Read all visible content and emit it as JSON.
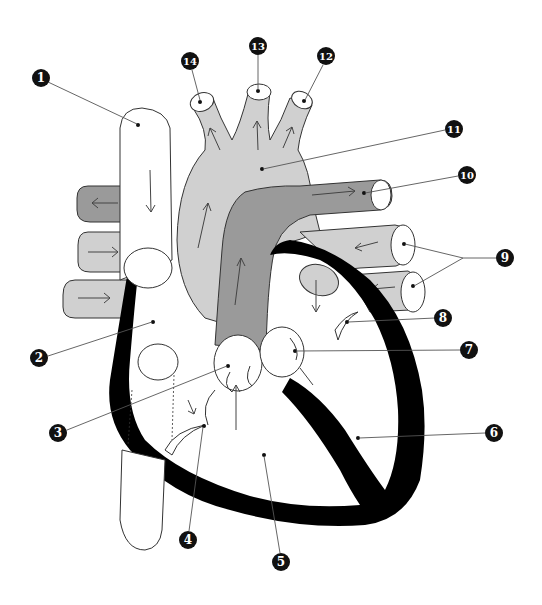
{
  "diagram": {
    "title": "",
    "colors": {
      "background": "#ffffff",
      "deoxygenated_vessel": "#9a9a9a",
      "oxygenated_vessel": "#d0d0d0",
      "myocardium": "#000000",
      "chamber_fill": "#ffffff",
      "label_badge": "#111111"
    },
    "labels": [
      {
        "id": "1",
        "text": "1",
        "x": 41,
        "y": 78
      },
      {
        "id": "2",
        "text": "2",
        "x": 39,
        "y": 358
      },
      {
        "id": "3",
        "text": "3",
        "x": 58,
        "y": 433
      },
      {
        "id": "4",
        "text": "4",
        "x": 188,
        "y": 540
      },
      {
        "id": "5",
        "text": "5",
        "x": 281,
        "y": 562
      },
      {
        "id": "6",
        "text": "6",
        "x": 494,
        "y": 433
      },
      {
        "id": "7",
        "text": "7",
        "x": 469,
        "y": 350
      },
      {
        "id": "8",
        "text": "8",
        "x": 443,
        "y": 318
      },
      {
        "id": "9",
        "text": "9",
        "x": 505,
        "y": 258
      },
      {
        "id": "10",
        "text": "10",
        "x": 467,
        "y": 175
      },
      {
        "id": "11",
        "text": "11",
        "x": 454,
        "y": 129
      },
      {
        "id": "12",
        "text": "12",
        "x": 326,
        "y": 56
      },
      {
        "id": "13",
        "text": "13",
        "x": 258,
        "y": 46
      },
      {
        "id": "14",
        "text": "14",
        "x": 190,
        "y": 61
      }
    ]
  }
}
